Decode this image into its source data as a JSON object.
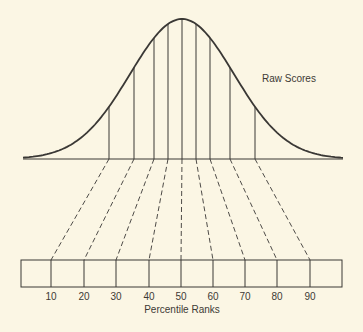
{
  "diagram": {
    "curve_label": "Raw Scores",
    "axis_label": "Percentile Ranks",
    "percentile_ticks": [
      "10",
      "20",
      "30",
      "40",
      "50",
      "60",
      "70",
      "80",
      "90"
    ],
    "colors": {
      "background": "#fbf6e4",
      "line": "#3a3835",
      "text": "#3d3a35"
    },
    "curve": {
      "left_x": 23,
      "right_x": 343,
      "baseline_y": 159,
      "peak_x": 182,
      "peak_y": 19
    },
    "raw_score_dividers_x": [
      109,
      134,
      154,
      168,
      182,
      196,
      210,
      230,
      255
    ],
    "raw_score_dividers_top_y": [
      90,
      57,
      31,
      22,
      19,
      22,
      32,
      57,
      90
    ],
    "rank_box": {
      "left_x": 21,
      "right_x": 342,
      "top_y": 260,
      "bottom_y": 287
    },
    "rank_dividers_x": [
      51,
      84,
      116,
      149,
      181,
      213,
      245,
      277,
      310
    ]
  }
}
